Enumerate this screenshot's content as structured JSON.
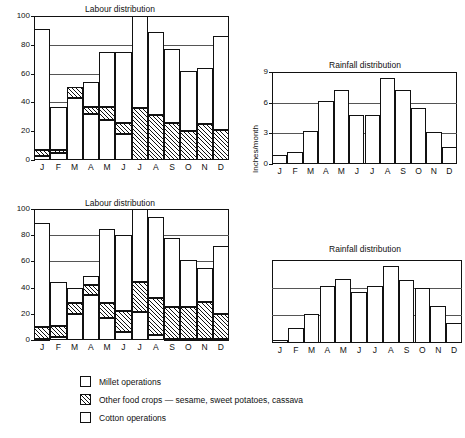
{
  "figure": {
    "legend": {
      "items": [
        {
          "key": "millet",
          "label": "Millet operations",
          "pattern": "stipple"
        },
        {
          "key": "other",
          "label": "Other food crops — sesame, sweet potatoes, cassava",
          "pattern": "hatch"
        },
        {
          "key": "cotton",
          "label": "Cotton operations",
          "pattern": "plain"
        }
      ]
    }
  },
  "chart_data": [
    {
      "id": "labour-top",
      "type": "bar",
      "title": "Labour distribution",
      "xlabel": "",
      "ylabel": "",
      "ylim": [
        0,
        100
      ],
      "yticks": [
        0,
        20,
        40,
        60,
        80,
        100
      ],
      "grid": true,
      "stacked": true,
      "categories": [
        "J",
        "F",
        "M",
        "A",
        "M",
        "J",
        "J",
        "A",
        "S",
        "O",
        "N",
        "D"
      ],
      "series": [
        {
          "name": "Millet operations",
          "pattern": "stipple",
          "values": [
            3,
            5,
            43,
            32,
            28,
            18,
            0,
            0,
            0,
            0,
            0,
            0
          ]
        },
        {
          "name": "Other food crops — sesame, sweet potatoes, cassava",
          "pattern": "hatch",
          "values": [
            4,
            2,
            8,
            5,
            9,
            8,
            36,
            31,
            26,
            20,
            25,
            21
          ]
        },
        {
          "name": "Cotton operations",
          "pattern": "plain",
          "values": [
            84,
            30,
            0,
            17,
            38,
            49,
            64,
            58,
            51,
            42,
            39,
            65
          ]
        }
      ],
      "totals": [
        91,
        37,
        51,
        54,
        75,
        75,
        100,
        89,
        77,
        62,
        64,
        86
      ]
    },
    {
      "id": "rainfall-top",
      "type": "bar",
      "title": "Rainfall distribution",
      "xlabel": "",
      "ylabel": "Inches/month",
      "ylim": [
        0,
        9
      ],
      "yticks": [
        0,
        3,
        6,
        9
      ],
      "grid": true,
      "categories": [
        "J",
        "F",
        "M",
        "A",
        "M",
        "J",
        "J",
        "A",
        "S",
        "O",
        "N",
        "D"
      ],
      "values": [
        0.9,
        1.2,
        3.2,
        6.2,
        7.2,
        4.8,
        4.8,
        8.4,
        7.2,
        5.5,
        3.1,
        1.7
      ]
    },
    {
      "id": "labour-bottom",
      "type": "bar",
      "title": "Labour distribution",
      "xlabel": "",
      "ylabel": "",
      "ylim": [
        0,
        100
      ],
      "yticks": [
        0,
        20,
        40,
        60,
        80,
        100
      ],
      "grid": true,
      "stacked": true,
      "categories": [
        "J",
        "F",
        "M",
        "A",
        "M",
        "J",
        "J",
        "A",
        "S",
        "O",
        "N",
        "D"
      ],
      "series": [
        {
          "name": "Millet operations",
          "pattern": "stipple",
          "values": [
            1,
            2,
            20,
            34,
            17,
            6,
            21,
            4,
            1,
            1,
            1,
            1
          ]
        },
        {
          "name": "Other food crops — sesame, sweet potatoes, cassava",
          "pattern": "hatch",
          "values": [
            9,
            9,
            8,
            8,
            11,
            16,
            23,
            28,
            24,
            24,
            28,
            19
          ]
        },
        {
          "name": "Cotton operations",
          "pattern": "plain",
          "values": [
            79,
            33,
            12,
            7,
            57,
            58,
            56,
            62,
            53,
            36,
            26,
            52
          ]
        }
      ],
      "totals": [
        89,
        44,
        40,
        49,
        85,
        80,
        100,
        94,
        78,
        61,
        55,
        72
      ]
    },
    {
      "id": "rainfall-bottom",
      "type": "bar",
      "title": "Rainfall distribution",
      "xlabel": "",
      "ylabel": "",
      "ylim": [
        0,
        9
      ],
      "yticks": [],
      "gridlines_at": [
        3,
        6
      ],
      "grid": true,
      "categories": [
        "J",
        "F",
        "M",
        "A",
        "M",
        "J",
        "J",
        "A",
        "S",
        "O",
        "N",
        "D"
      ],
      "values": [
        0.3,
        1.6,
        3.1,
        6.2,
        6.9,
        5.5,
        6.2,
        8.3,
        6.8,
        6.0,
        4.0,
        2.2
      ]
    }
  ]
}
